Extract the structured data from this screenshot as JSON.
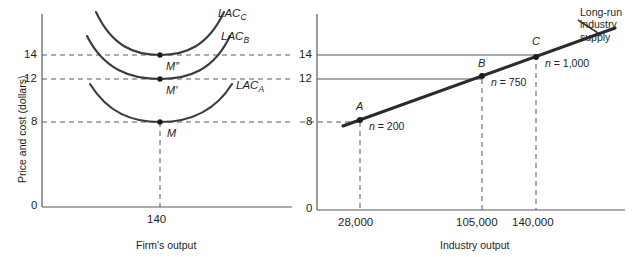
{
  "figure": {
    "title": "",
    "background_color": "#ffffff",
    "ink_color": "#231f20"
  },
  "left_panel": {
    "name": "firm-panel",
    "y_axis_title": "Price and cost (dollars)",
    "x_axis_title": "Firm's output",
    "y_tick_labels": [
      "14",
      "12",
      "8",
      "0"
    ],
    "x_tick_labels": [
      "140"
    ],
    "curve_labels": [
      {
        "base": "LAC",
        "sub": "C"
      },
      {
        "base": "LAC",
        "sub": "B"
      },
      {
        "base": "LAC",
        "sub": "A"
      }
    ],
    "point_labels": [
      "M″",
      "M′",
      "M"
    ]
  },
  "right_panel": {
    "name": "industry-panel",
    "x_axis_title": "Industry output",
    "y_tick_labels": [
      "14",
      "12",
      "8",
      "0"
    ],
    "x_tick_labels": [
      "28,000",
      "105,000",
      "140,000"
    ],
    "supply_label_line1": "Long-run",
    "supply_label_line2": "industry",
    "supply_label_line3": "supply",
    "points": [
      {
        "label": "A",
        "n_label": "n = 200",
        "price": 8,
        "output": "28,000"
      },
      {
        "label": "B",
        "n_label": "n = 750",
        "price": 12,
        "output": "105,000"
      },
      {
        "label": "C",
        "n_label": "n = 1,000",
        "price": 14,
        "output": "140,000"
      }
    ]
  },
  "chart_data": {
    "type": "line",
    "panels": [
      {
        "name": "Firm's cost curves",
        "type": "line",
        "xlabel": "Firm's output",
        "ylabel": "Price and cost (dollars)",
        "xticks": [
          140
        ],
        "yticks": [
          0,
          8,
          12,
          14
        ],
        "ylim": [
          0,
          17
        ],
        "grid": false,
        "series": [
          {
            "name": "LAC_A",
            "min_point": {
              "x": 140,
              "y": 8
            },
            "label": "LAC_A"
          },
          {
            "name": "LAC_B",
            "min_point": {
              "x": 140,
              "y": 12
            },
            "label": "LAC_B"
          },
          {
            "name": "LAC_C",
            "min_point": {
              "x": 140,
              "y": 14
            },
            "label": "LAC_C"
          }
        ],
        "annotations": [
          {
            "text": "M",
            "x": 140,
            "y": 8
          },
          {
            "text": "M′",
            "x": 140,
            "y": 12
          },
          {
            "text": "M″",
            "x": 140,
            "y": 14
          }
        ]
      },
      {
        "name": "Long-run industry supply",
        "type": "line",
        "xlabel": "Industry output",
        "ylabel": "Price and cost (dollars)",
        "xticks": [
          28000,
          105000,
          140000
        ],
        "yticks": [
          0,
          8,
          12,
          14
        ],
        "ylim": [
          0,
          17
        ],
        "grid": false,
        "x": [
          28000,
          105000,
          140000
        ],
        "y": [
          8,
          12,
          14
        ],
        "series": [
          {
            "name": "Long-run industry supply",
            "x": [
              28000,
              105000,
              140000
            ],
            "y": [
              8,
              12,
              14
            ]
          }
        ],
        "annotations": [
          {
            "text": "A, n = 200",
            "x": 28000,
            "y": 8
          },
          {
            "text": "B, n = 750",
            "x": 105000,
            "y": 12
          },
          {
            "text": "C, n = 1,000",
            "x": 140000,
            "y": 14
          }
        ]
      }
    ]
  }
}
